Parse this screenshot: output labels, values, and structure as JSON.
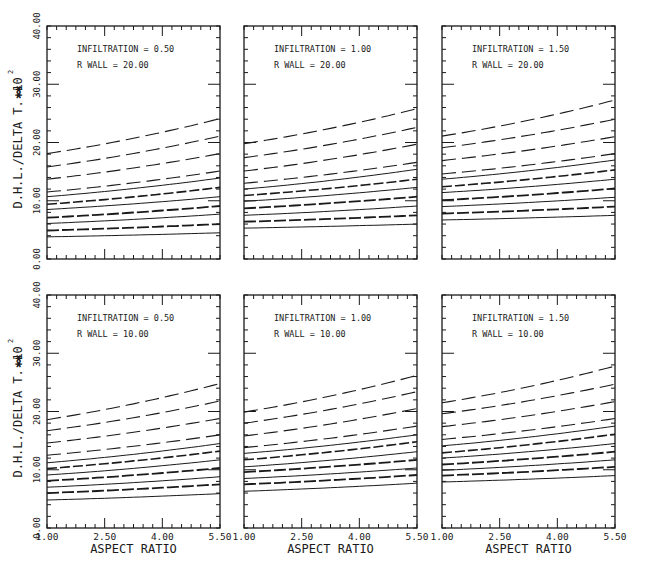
{
  "figure": {
    "y_axis_label": "D.H.L./DELTA T. ✱",
    "y_axis_multiplier": "10",
    "y_axis_multiplier_exp": "2",
    "x_axis_label": "ASPECT RATIO",
    "x_ticks": [
      "1.00",
      "2.50",
      "4.00",
      "5.50"
    ],
    "y_ticks": [
      "0.00",
      "10.00",
      "20.00",
      "30.00",
      "40.00"
    ]
  },
  "chart_data": [
    {
      "type": "line",
      "title": "INFILTRATION = 0.50 / R WALL = 20.00",
      "annotation": [
        "INFILTRATION = 0.50",
        "R WALL = 20.00"
      ],
      "xlabel": "ASPECT RATIO",
      "ylabel": "D.H.L./DELTA T. x10^2",
      "xlim": [
        1.0,
        5.5
      ],
      "ylim": [
        0,
        40
      ],
      "grid": false,
      "x": [
        1.0,
        5.5
      ],
      "series": [
        {
          "name": "curve-1",
          "style": "long-dash",
          "values": [
            18.1,
            24.1
          ]
        },
        {
          "name": "curve-2",
          "style": "long-dash",
          "values": [
            15.8,
            21.1
          ]
        },
        {
          "name": "curve-3",
          "style": "long-dash",
          "values": [
            13.7,
            18.1
          ]
        },
        {
          "name": "curve-4",
          "style": "long-dash",
          "values": [
            11.5,
            15.1
          ]
        },
        {
          "name": "curve-5",
          "style": "solid",
          "values": [
            10.7,
            13.9
          ]
        },
        {
          "name": "curve-6",
          "style": "medium-dash",
          "values": [
            9.4,
            12.3
          ]
        },
        {
          "name": "curve-7",
          "style": "solid",
          "values": [
            8.5,
            10.7
          ]
        },
        {
          "name": "curve-8",
          "style": "heavy-dash",
          "values": [
            7.1,
            9.1
          ]
        },
        {
          "name": "curve-9",
          "style": "solid",
          "values": [
            6.1,
            7.7
          ]
        },
        {
          "name": "curve-10",
          "style": "heavy-dash",
          "values": [
            4.9,
            6.0
          ]
        },
        {
          "name": "curve-11",
          "style": "solid",
          "values": [
            3.8,
            4.5
          ]
        }
      ]
    },
    {
      "type": "line",
      "title": "INFILTRATION = 1.00 / R WALL = 20.00",
      "annotation": [
        "INFILTRATION = 1.00",
        "R WALL = 20.00"
      ],
      "xlabel": "ASPECT RATIO",
      "ylabel": "D.H.L./DELTA T. x10^2",
      "xlim": [
        1.0,
        5.5
      ],
      "ylim": [
        0,
        40
      ],
      "grid": false,
      "x": [
        1.0,
        5.5
      ],
      "series": [
        {
          "name": "curve-1",
          "style": "long-dash",
          "values": [
            19.8,
            25.8
          ]
        },
        {
          "name": "curve-2",
          "style": "long-dash",
          "values": [
            17.4,
            22.6
          ]
        },
        {
          "name": "curve-3",
          "style": "long-dash",
          "values": [
            15.1,
            19.7
          ]
        },
        {
          "name": "curve-4",
          "style": "long-dash",
          "values": [
            13.0,
            16.6
          ]
        },
        {
          "name": "curve-5",
          "style": "solid",
          "values": [
            12.0,
            15.4
          ]
        },
        {
          "name": "curve-6",
          "style": "medium-dash",
          "values": [
            10.9,
            13.7
          ]
        },
        {
          "name": "curve-7",
          "style": "solid",
          "values": [
            9.9,
            12.3
          ]
        },
        {
          "name": "curve-8",
          "style": "heavy-dash",
          "values": [
            8.7,
            10.7
          ]
        },
        {
          "name": "curve-9",
          "style": "solid",
          "values": [
            7.5,
            9.1
          ]
        },
        {
          "name": "curve-10",
          "style": "heavy-dash",
          "values": [
            6.4,
            7.5
          ]
        },
        {
          "name": "curve-11",
          "style": "solid",
          "values": [
            5.3,
            6.0
          ]
        }
      ]
    },
    {
      "type": "line",
      "title": "INFILTRATION = 1.50 / R WALL = 20.00",
      "annotation": [
        "INFILTRATION = 1.50",
        "R WALL = 20.00"
      ],
      "xlabel": "ASPECT RATIO",
      "ylabel": "D.H.L./DELTA T. x10^2",
      "xlim": [
        1.0,
        5.5
      ],
      "ylim": [
        0,
        40
      ],
      "grid": false,
      "x": [
        1.0,
        5.5
      ],
      "series": [
        {
          "name": "curve-1",
          "style": "long-dash",
          "values": [
            21.1,
            27.3
          ]
        },
        {
          "name": "curve-2",
          "style": "long-dash",
          "values": [
            19.1,
            24.0
          ]
        },
        {
          "name": "curve-3",
          "style": "long-dash",
          "values": [
            16.9,
            21.0
          ]
        },
        {
          "name": "curve-4",
          "style": "long-dash",
          "values": [
            14.6,
            18.1
          ]
        },
        {
          "name": "curve-5",
          "style": "solid",
          "values": [
            13.7,
            17.0
          ]
        },
        {
          "name": "curve-6",
          "style": "medium-dash",
          "values": [
            12.4,
            15.3
          ]
        },
        {
          "name": "curve-7",
          "style": "solid",
          "values": [
            11.4,
            13.7
          ]
        },
        {
          "name": "curve-8",
          "style": "heavy-dash",
          "values": [
            10.1,
            12.1
          ]
        },
        {
          "name": "curve-9",
          "style": "solid",
          "values": [
            9.0,
            10.6
          ]
        },
        {
          "name": "curve-10",
          "style": "heavy-dash",
          "values": [
            7.8,
            9.0
          ]
        },
        {
          "name": "curve-11",
          "style": "solid",
          "values": [
            6.7,
            7.5
          ]
        }
      ]
    },
    {
      "type": "line",
      "title": "INFILTRATION = 0.50 / R WALL = 10.00",
      "annotation": [
        "INFILTRATION = 0.50",
        "R WALL = 10.00"
      ],
      "xlabel": "ASPECT RATIO",
      "ylabel": "D.H.L./DELTA T. x10^2",
      "xlim": [
        1.0,
        5.5
      ],
      "ylim": [
        0,
        40
      ],
      "grid": false,
      "x": [
        1.0,
        5.5
      ],
      "series": [
        {
          "name": "curve-1",
          "style": "long-dash",
          "values": [
            18.6,
            24.8
          ]
        },
        {
          "name": "curve-2",
          "style": "long-dash",
          "values": [
            16.7,
            21.8
          ]
        },
        {
          "name": "curve-3",
          "style": "long-dash",
          "values": [
            14.6,
            18.8
          ]
        },
        {
          "name": "curve-4",
          "style": "long-dash",
          "values": [
            12.5,
            16.0
          ]
        },
        {
          "name": "curve-5",
          "style": "solid",
          "values": [
            11.2,
            14.5
          ]
        },
        {
          "name": "curve-6",
          "style": "medium-dash",
          "values": [
            10.2,
            13.2
          ]
        },
        {
          "name": "curve-7",
          "style": "solid",
          "values": [
            9.1,
            11.7
          ]
        },
        {
          "name": "curve-8",
          "style": "heavy-dash",
          "values": [
            8.1,
            10.3
          ]
        },
        {
          "name": "curve-9",
          "style": "solid",
          "values": [
            7.0,
            8.8
          ]
        },
        {
          "name": "curve-10",
          "style": "heavy-dash",
          "values": [
            6.0,
            7.5
          ]
        },
        {
          "name": "curve-11",
          "style": "solid",
          "values": [
            4.8,
            5.9
          ]
        }
      ]
    },
    {
      "type": "line",
      "title": "INFILTRATION = 1.00 / R WALL = 10.00",
      "annotation": [
        "INFILTRATION = 1.00",
        "R WALL = 10.00"
      ],
      "xlabel": "ASPECT RATIO",
      "ylabel": "D.H.L./DELTA T. x10^2",
      "xlim": [
        1.0,
        5.5
      ],
      "ylim": [
        0,
        40
      ],
      "grid": false,
      "x": [
        1.0,
        5.5
      ],
      "series": [
        {
          "name": "curve-1",
          "style": "long-dash",
          "values": [
            19.9,
            26.2
          ]
        },
        {
          "name": "curve-2",
          "style": "long-dash",
          "values": [
            18.0,
            23.4
          ]
        },
        {
          "name": "curve-3",
          "style": "long-dash",
          "values": [
            15.8,
            20.5
          ]
        },
        {
          "name": "curve-4",
          "style": "long-dash",
          "values": [
            13.8,
            17.5
          ]
        },
        {
          "name": "curve-5",
          "style": "solid",
          "values": [
            12.8,
            16.0
          ]
        },
        {
          "name": "curve-6",
          "style": "medium-dash",
          "values": [
            11.7,
            14.8
          ]
        },
        {
          "name": "curve-7",
          "style": "solid",
          "values": [
            10.5,
            13.1
          ]
        },
        {
          "name": "curve-8",
          "style": "heavy-dash",
          "values": [
            9.6,
            11.7
          ]
        },
        {
          "name": "curve-9",
          "style": "solid",
          "values": [
            8.5,
            10.3
          ]
        },
        {
          "name": "curve-10",
          "style": "heavy-dash",
          "values": [
            7.5,
            9.1
          ]
        },
        {
          "name": "curve-11",
          "style": "solid",
          "values": [
            6.3,
            7.7
          ]
        }
      ]
    },
    {
      "type": "line",
      "title": "INFILTRATION = 1.50 / R WALL = 10.00",
      "annotation": [
        "INFILTRATION = 1.50",
        "R WALL = 10.00"
      ],
      "xlabel": "ASPECT RATIO",
      "ylabel": "D.H.L./DELTA T. x10^2",
      "xlim": [
        1.0,
        5.5
      ],
      "ylim": [
        0,
        40
      ],
      "grid": false,
      "x": [
        1.0,
        5.5
      ],
      "series": [
        {
          "name": "curve-1",
          "style": "long-dash",
          "values": [
            21.5,
            27.8
          ]
        },
        {
          "name": "curve-2",
          "style": "long-dash",
          "values": [
            19.6,
            24.7
          ]
        },
        {
          "name": "curve-3",
          "style": "long-dash",
          "values": [
            17.4,
            21.7
          ]
        },
        {
          "name": "curve-4",
          "style": "long-dash",
          "values": [
            15.2,
            18.8
          ]
        },
        {
          "name": "curve-5",
          "style": "solid",
          "values": [
            14.1,
            17.5
          ]
        },
        {
          "name": "curve-6",
          "style": "medium-dash",
          "values": [
            12.9,
            16.1
          ]
        },
        {
          "name": "curve-7",
          "style": "solid",
          "values": [
            12.0,
            14.5
          ]
        },
        {
          "name": "curve-8",
          "style": "heavy-dash",
          "values": [
            10.9,
            13.1
          ]
        },
        {
          "name": "curve-9",
          "style": "solid",
          "values": [
            9.9,
            11.7
          ]
        },
        {
          "name": "curve-10",
          "style": "heavy-dash",
          "values": [
            9.0,
            10.5
          ]
        },
        {
          "name": "curve-11",
          "style": "solid",
          "values": [
            7.9,
            9.0
          ]
        }
      ]
    }
  ]
}
